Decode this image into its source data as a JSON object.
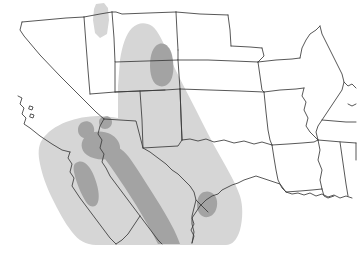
{
  "map": {
    "title": "Southwestern United States distribution map",
    "type": "choropleth-range-map",
    "projection": "geographic",
    "width": 358,
    "height": 264,
    "background_color": "#ffffff",
    "border_color": "#3a3a3a",
    "border_width": 0.8,
    "coastline_color": "#2b2b2b",
    "legend_visible": false,
    "labels_visible": false,
    "shading_levels": [
      {
        "name": "outer-range",
        "label": "Outer range (light)",
        "color": "#d6d6d6"
      },
      {
        "name": "core-range",
        "label": "Core range (dark)",
        "color": "#a3a3a3"
      }
    ],
    "regions_shown": [
      "California",
      "Nevada",
      "Utah",
      "Idaho",
      "Wyoming",
      "Colorado",
      "Arizona",
      "New Mexico",
      "Texas",
      "Oklahoma",
      "Kansas",
      "Nebraska",
      "Missouri",
      "Arkansas",
      "Louisiana",
      "Mississippi",
      "Alabama",
      "Illinois",
      "Kentucky",
      "Tennessee",
      "Baja California",
      "Sonora",
      "Chihuahua",
      "Coahuila",
      "Nuevo Leon",
      "Tamaulipas"
    ],
    "outer_range_patches": 2,
    "core_range_patches": 6
  }
}
